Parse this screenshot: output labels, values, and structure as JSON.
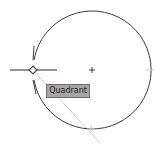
{
  "drawing": {
    "circle": {
      "cx": 92,
      "cy": 70,
      "r": 59,
      "stroke": "#3c3c3c"
    },
    "center_marker": {
      "x": 92,
      "y": 70,
      "symbol": "+"
    },
    "snap_marker": {
      "x": 33,
      "y": 70,
      "type": "quadrant-diamond"
    },
    "crosshair": {
      "x": 33,
      "y": 70
    },
    "tracking_line": {
      "x1": 33,
      "y1": 70,
      "x2": 100,
      "y2": 143,
      "color": "#c8c8c8"
    }
  },
  "tooltip": {
    "label": "Quadrant"
  }
}
